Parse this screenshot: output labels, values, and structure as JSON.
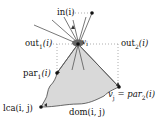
{
  "diagram": {
    "type": "graph-dominator-region",
    "colors": {
      "region_fill": "#d9d9d9",
      "stroke": "#333333",
      "dotted": "#999999",
      "node": "#111111"
    },
    "nodes": {
      "v_i": {
        "label": "v",
        "sub": "i",
        "x": 78,
        "y": 44
      },
      "in_dot": {
        "x": 92,
        "y": 13
      },
      "par1_dot": {
        "x": 57,
        "y": 73
      },
      "v_j": {
        "x": 119,
        "y": 87
      },
      "lca_dot": {
        "x": 41,
        "y": 107
      }
    },
    "labels": {
      "in": "in(i)",
      "out1_main": "out",
      "out1_sub": "1",
      "out1_arg": "(i)",
      "out2_main": "out",
      "out2_sub": "2",
      "out2_arg": "(i)",
      "par1_main": "par",
      "par1_sub": "1",
      "par1_arg": "(i)",
      "vj_main": "v",
      "vj_sub": "j",
      "vj_eq": " = ",
      "par2_main": "par",
      "par2_sub": "2",
      "par2_arg": "(i)",
      "vi_main": "v",
      "vi_sub": "i",
      "lca": "lca(i, j)",
      "dom": "dom(i, j)"
    }
  }
}
